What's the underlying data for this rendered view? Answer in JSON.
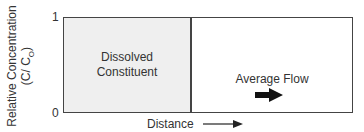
{
  "diagram": {
    "y_axis": {
      "label_line1": "Relative Concentration",
      "label_line2_prefix": "(C/ C",
      "label_line2_sub": "O",
      "label_line2_suffix": ")",
      "tick_top": "1",
      "tick_bottom": "0"
    },
    "x_axis": {
      "label": "Distance"
    },
    "regions": [
      {
        "name": "dissolved-constituent",
        "label_line1": "Dissolved",
        "label_line2": "Constituent",
        "fill": "#efefef"
      },
      {
        "name": "average-flow",
        "label": "Average Flow",
        "fill": "#ffffff"
      }
    ],
    "colors": {
      "line": "#444444",
      "text": "#333333",
      "shaded": "#efefef"
    }
  }
}
